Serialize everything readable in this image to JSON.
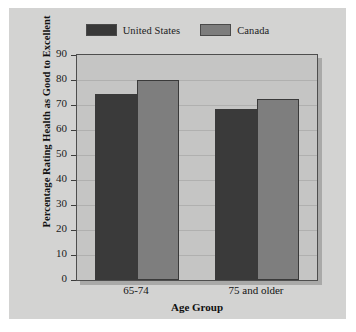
{
  "chart_data": {
    "type": "bar",
    "title": "",
    "subtitle": "",
    "xlabel": "Age Group",
    "ylabel": "Percentage Rating Health as Good to Excellent",
    "categories": [
      "65-74",
      "75 and older"
    ],
    "series": [
      {
        "name": "United States",
        "color": "#3a3a3a",
        "values": [
          74.5,
          68.5
        ]
      },
      {
        "name": "Canada",
        "color": "#7e7e7e",
        "values": [
          80,
          72.5
        ]
      }
    ],
    "ylim": [
      0,
      90
    ],
    "ytick_step": 10,
    "yticks": [
      90,
      80,
      70,
      60,
      50,
      40,
      30,
      20,
      10,
      0
    ],
    "grid": true,
    "legend_position": "top-center"
  },
  "legend": {
    "entries": [
      {
        "label": "United States",
        "swatch": "legend-swatch-united-states"
      },
      {
        "label": "Canada",
        "swatch": "legend-swatch-canada"
      }
    ]
  },
  "colors": {
    "figure_background": "#d3d3d2",
    "plot_background": "#c5c5c4",
    "plot_border": "#4e4e4e",
    "gridline": "#b0b0af",
    "series_united_states": "#3a3a3a",
    "series_canada": "#7e7e7e",
    "text": "#141414"
  }
}
